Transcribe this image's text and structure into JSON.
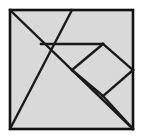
{
  "figure": {
    "name": "tangram-square-dissection",
    "canvas": {
      "width": 143,
      "height": 140
    },
    "colors": {
      "background": "#ffffff",
      "fill": "#d9d9d9",
      "stroke": "#1a1a1a",
      "outline": "#111111"
    },
    "stroke_width": 2.4,
    "outline_width": 2.6,
    "square": {
      "name": "outer-square",
      "x": 10,
      "y": 10,
      "width": 123,
      "height": 119
    },
    "vertices": {
      "top_left": [
        10,
        10
      ],
      "top_mid": [
        72,
        10
      ],
      "top_right": [
        133,
        10
      ],
      "right_mid": [
        133,
        70
      ],
      "bottom_right": [
        133,
        129
      ],
      "bottom_mid": [
        72,
        129
      ],
      "bottom_left": [
        10,
        129
      ],
      "left_mid": [
        10,
        70
      ],
      "center": [
        72,
        70
      ],
      "horiz_left": [
        41,
        44
      ],
      "horiz_right": [
        103,
        44
      ],
      "diamond_bottom": [
        103,
        96
      ]
    },
    "cuts": [
      {
        "name": "main-diagonal",
        "label": "top-left to bottom-right diagonal",
        "points": "10,10 133,129"
      },
      {
        "name": "second-diagonal",
        "label": "top-mid to bottom-left diagonal",
        "points": "72,10 10,129"
      },
      {
        "name": "horizontal-cut",
        "label": "horizontal chord",
        "points": "41,44 103,44"
      },
      {
        "name": "diamond-upper-right-edge",
        "label": "upper right diamond edge",
        "points": "103,44 133,70"
      },
      {
        "name": "diamond-lower-right-edge",
        "label": "lower right diamond edge",
        "points": "133,70 103,96"
      },
      {
        "name": "diamond-lower-left-edge",
        "label": "lower left diamond edge",
        "points": "103,96 72,70"
      },
      {
        "name": "diamond-upper-left-edge",
        "label": "upper left diamond edge",
        "points": "72,70 103,44"
      },
      {
        "name": "bottom-right-cut",
        "label": "diamond bottom vertex to bottom-right corner",
        "points": "103,96 133,129"
      }
    ],
    "pieces": [
      {
        "name": "piece-large-triangle-top",
        "points": "10,10 72,10 41,44"
      },
      {
        "name": "piece-large-triangle-left",
        "points": "10,10 41,44 72,70 10,129"
      },
      {
        "name": "piece-triangle-top-right",
        "points": "72,10 133,10 133,70 103,44"
      },
      {
        "name": "piece-parallelogram",
        "points": "41,44 103,44 72,70"
      },
      {
        "name": "piece-square-diamond",
        "points": "103,44 133,70 103,96 72,70"
      },
      {
        "name": "piece-triangle-bottom",
        "points": "10,129 72,70 103,96 133,129"
      },
      {
        "name": "piece-triangle-right-lower",
        "points": "133,70 133,129 103,96"
      }
    ]
  }
}
